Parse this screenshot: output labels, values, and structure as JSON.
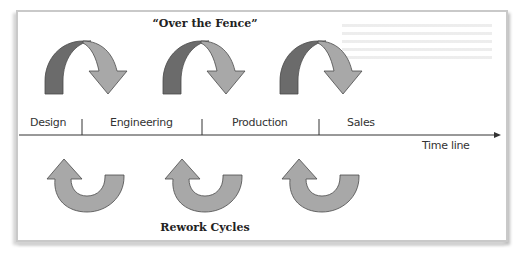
{
  "diagram": {
    "top_title": "“Over the Fence”",
    "bottom_title": "Rework Cycles",
    "axis_label": "Time line",
    "phases": [
      {
        "label": "Design"
      },
      {
        "label": "Engineering"
      },
      {
        "label": "Production"
      },
      {
        "label": "Sales"
      }
    ],
    "handoff_arrows": [
      {
        "from": "Design",
        "to": "Engineering"
      },
      {
        "from": "Engineering",
        "to": "Production"
      },
      {
        "from": "Production",
        "to": "Sales"
      }
    ],
    "rework_arrows": [
      {
        "from": "Engineering",
        "to": "Design"
      },
      {
        "from": "Production",
        "to": "Engineering"
      },
      {
        "from": "Sales",
        "to": "Production"
      }
    ],
    "colors": {
      "arrow_dark": "#6b6b6b",
      "arrow_light": "#a8a8a8",
      "arrow_outline": "#4a4a4a",
      "line": "#333333",
      "frame_border": "#c9c9c9"
    }
  }
}
